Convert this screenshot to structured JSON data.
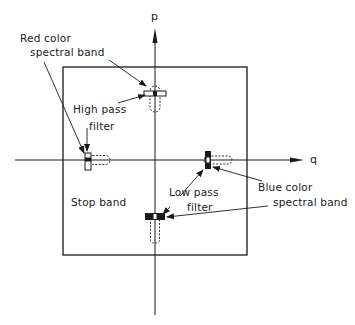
{
  "diagram": {
    "axes": {
      "vertical_label": "p",
      "horizontal_label": "q"
    },
    "labels": {
      "red_band_line1": "Red color",
      "red_band_line2": "spectral band",
      "high_pass_line1": "High pass",
      "high_pass_line2": "filter",
      "stop_band": "Stop band",
      "low_pass_line1": "Low pass",
      "low_pass_line2": "filter",
      "blue_band_line1": "Blue color",
      "blue_band_line2": "spectral band"
    },
    "colors": {
      "ink": "#1a1a1a",
      "background": "#ffffff"
    }
  }
}
